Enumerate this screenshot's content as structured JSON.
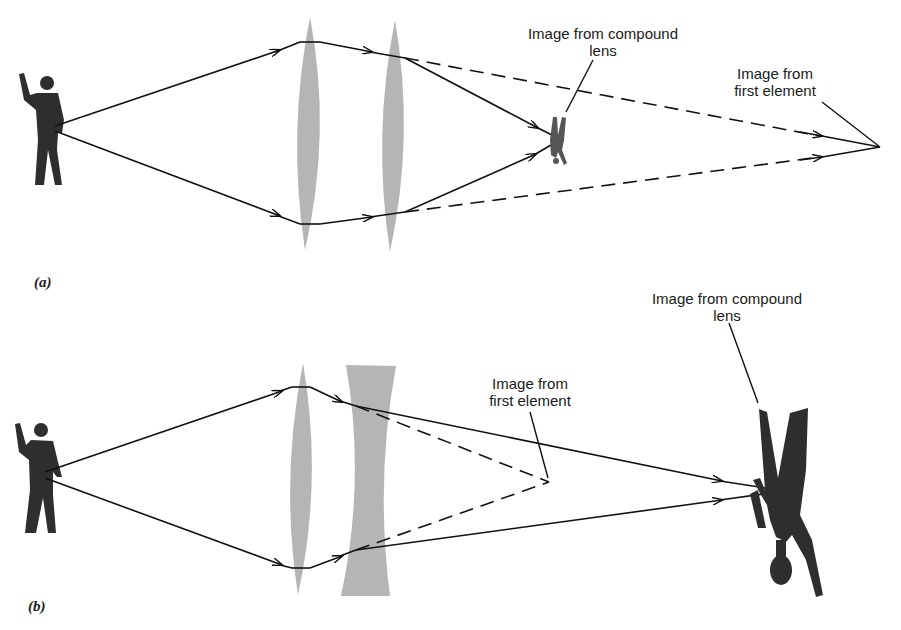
{
  "panels": [
    {
      "id": "a",
      "label": "(a)",
      "description": "Two converging lenses",
      "annotations": {
        "compound_image": {
          "line1": "Image from compound",
          "line2": "lens"
        },
        "first_element_image": {
          "line1": "Image from",
          "line2": "first element"
        }
      }
    },
    {
      "id": "b",
      "label": "(b)",
      "description": "Converging lens followed by diverging lens",
      "annotations": {
        "compound_image": {
          "line1": "Image from compound",
          "line2": "lens"
        },
        "first_element_image": {
          "line1": "Image from",
          "line2": "first element"
        }
      }
    }
  ],
  "colors": {
    "lens": "#9a9a9a",
    "figure": "#2e2e2e",
    "ray": "#111111"
  }
}
